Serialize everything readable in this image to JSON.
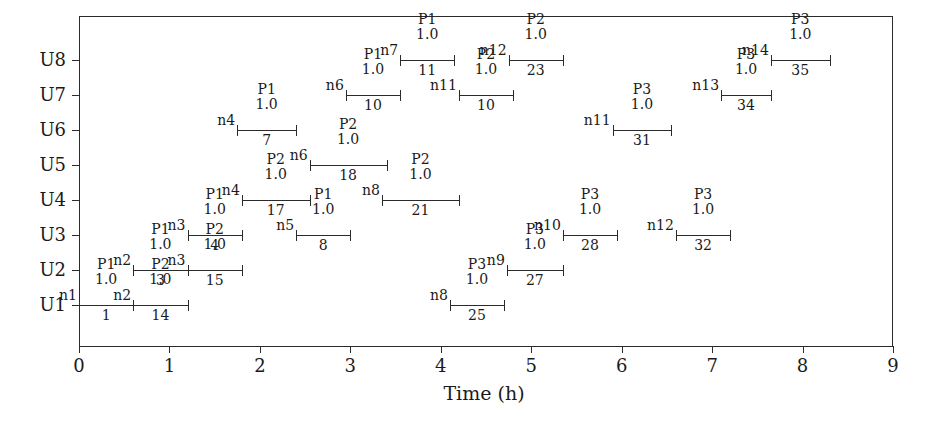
{
  "chart_data": {
    "type": "bar",
    "subtype": "gantt",
    "title": "",
    "xlabel": "Time (h)",
    "ylabel": "",
    "xlim": [
      0,
      9
    ],
    "xticks": [
      "0",
      "1",
      "2",
      "3",
      "4",
      "5",
      "6",
      "7",
      "8",
      "9"
    ],
    "yticks": [
      "U1",
      "U2",
      "U3",
      "U4",
      "U5",
      "U6",
      "U7",
      "U8"
    ],
    "grid": false,
    "legend": "none",
    "value_label": "1.0",
    "tasks": [
      {
        "unit": "U1",
        "node": "n1",
        "process": "P1",
        "value": "1.0",
        "id": "1",
        "start": 0.0,
        "end": 0.6
      },
      {
        "unit": "U1",
        "node": "n2",
        "process": "P2",
        "value": "1.0",
        "id": "14",
        "start": 0.6,
        "end": 1.2
      },
      {
        "unit": "U2",
        "node": "n2",
        "process": "P1",
        "value": "1.0",
        "id": "3",
        "start": 0.6,
        "end": 1.2
      },
      {
        "unit": "U2",
        "node": "n3",
        "process": "P2",
        "value": "1.0",
        "id": "15",
        "start": 1.2,
        "end": 1.8
      },
      {
        "unit": "U3",
        "node": "n3",
        "process": "P1",
        "value": "1.0",
        "id": "4",
        "start": 1.2,
        "end": 1.8
      },
      {
        "unit": "U3",
        "node": "n5",
        "process": "P1",
        "value": "1.0",
        "id": "8",
        "start": 2.4,
        "end": 3.0
      },
      {
        "unit": "U3",
        "node": "n10",
        "process": "P3",
        "value": "1.0",
        "id": "28",
        "start": 5.35,
        "end": 5.95
      },
      {
        "unit": "U3",
        "node": "n12",
        "process": "P3",
        "value": "1.0",
        "id": "32",
        "start": 6.6,
        "end": 7.2
      },
      {
        "unit": "U4",
        "node": "n4",
        "process": "P2",
        "value": "1.0",
        "id": "17",
        "start": 1.8,
        "end": 2.55
      },
      {
        "unit": "U4",
        "node": "n8",
        "process": "P2",
        "value": "1.0",
        "id": "21",
        "start": 3.35,
        "end": 4.2
      },
      {
        "unit": "U5",
        "node": "n6",
        "process": "P2",
        "value": "1.0",
        "id": "18",
        "start": 2.55,
        "end": 3.4
      },
      {
        "unit": "U6",
        "node": "n4",
        "process": "P1",
        "value": "1.0",
        "id": "7",
        "start": 1.75,
        "end": 2.4
      },
      {
        "unit": "U6",
        "node": "n11",
        "process": "P3",
        "value": "1.0",
        "id": "31",
        "start": 5.9,
        "end": 6.55
      },
      {
        "unit": "U7",
        "node": "n6",
        "process": "P1",
        "value": "1.0",
        "id": "10",
        "start": 2.95,
        "end": 3.55
      },
      {
        "unit": "U7",
        "node": "n11",
        "process": "P2",
        "value": "1.0",
        "id": "10",
        "start": 4.2,
        "end": 4.8
      },
      {
        "unit": "U7",
        "node": "n13",
        "process": "P3",
        "value": "1.0",
        "id": "34",
        "start": 7.1,
        "end": 7.65
      },
      {
        "unit": "U8",
        "node": "n7",
        "process": "P1",
        "value": "1.0",
        "id": "11",
        "start": 3.55,
        "end": 4.15
      },
      {
        "unit": "U8",
        "node": "n12",
        "process": "P2",
        "value": "1.0",
        "id": "23",
        "start": 4.75,
        "end": 5.35
      },
      {
        "unit": "U8",
        "node": "n14",
        "process": "P3",
        "value": "1.0",
        "id": "35",
        "start": 7.65,
        "end": 8.3
      },
      {
        "unit": "U1",
        "node": "n8",
        "process": "P3",
        "value": "1.0",
        "id": "25",
        "start": 4.1,
        "end": 4.7
      },
      {
        "unit": "U2",
        "node": "n9",
        "process": "P3",
        "value": "1.0",
        "id": "27",
        "start": 4.73,
        "end": 5.35
      }
    ],
    "colors": {
      "axis": "#2b2b2b",
      "bar": "#2b2b2b",
      "text": "#1a1a1a",
      "background": "#ffffff"
    }
  }
}
